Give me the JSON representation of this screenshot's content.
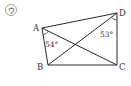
{
  "figure_label": "ウ",
  "vertices": {
    "A": {
      "label": "A",
      "x": 42,
      "y": 28
    },
    "B": {
      "label": "B",
      "x": 48,
      "y": 65
    },
    "C": {
      "label": "C",
      "x": 117,
      "y": 65
    },
    "D": {
      "label": "D",
      "x": 117,
      "y": 13
    }
  },
  "angles": {
    "angle_A": {
      "label": "54°"
    },
    "angle_D": {
      "label": "53°"
    }
  },
  "colors": {
    "stroke": "#2a2a2a",
    "text": "#333333"
  }
}
